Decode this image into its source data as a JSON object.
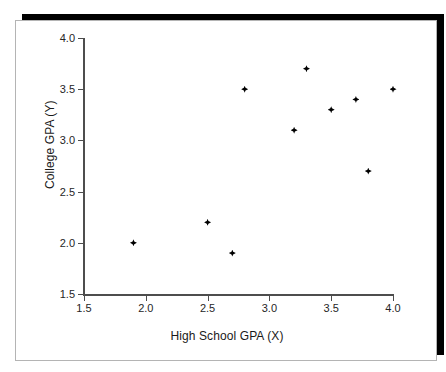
{
  "chart_data": {
    "type": "scatter",
    "title": "",
    "xlabel": "High School GPA (X)",
    "ylabel": "College GPA (Y)",
    "xlim": [
      1.5,
      4.0
    ],
    "ylim": [
      1.5,
      4.0
    ],
    "xticks": [
      "1.5",
      "2.0",
      "2.5",
      "3.0",
      "3.5",
      "4.0"
    ],
    "yticks": [
      "1.5",
      "2.0",
      "2.5",
      "3.0",
      "3.5",
      "4.0"
    ],
    "xtick_values": [
      1.5,
      2.0,
      2.5,
      3.0,
      3.5,
      4.0
    ],
    "ytick_values": [
      1.5,
      2.0,
      2.5,
      3.0,
      3.5,
      4.0
    ],
    "grid": false,
    "legend": false,
    "marker_color": "#000000",
    "axis_color": "#4d4d4d",
    "background_color": "#ffffff",
    "points": [
      {
        "x": 1.9,
        "y": 2.0
      },
      {
        "x": 2.5,
        "y": 2.2
      },
      {
        "x": 2.7,
        "y": 1.9
      },
      {
        "x": 2.8,
        "y": 3.5
      },
      {
        "x": 3.2,
        "y": 3.1
      },
      {
        "x": 3.3,
        "y": 3.7
      },
      {
        "x": 3.5,
        "y": 3.3
      },
      {
        "x": 3.7,
        "y": 3.4
      },
      {
        "x": 3.8,
        "y": 2.7
      },
      {
        "x": 4.0,
        "y": 3.5
      }
    ]
  }
}
